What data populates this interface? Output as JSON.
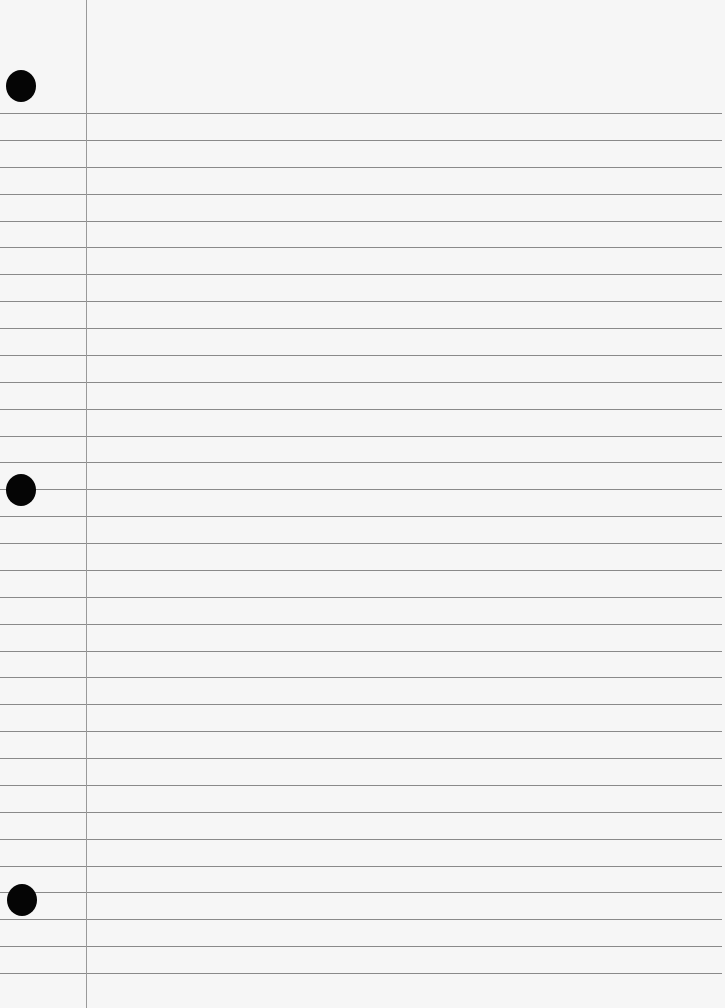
{
  "paper": {
    "type": "ruled notebook paper",
    "background_color": "#f6f6f6",
    "rule_color": "#8a8a8a",
    "margin_color": "#9a9a9a",
    "margin_x": 86,
    "first_rule_y": 113,
    "rule_spacing": 26.875,
    "rule_count": 33,
    "holes": [
      {
        "x": 6,
        "y": 70
      },
      {
        "x": 6,
        "y": 474
      },
      {
        "x": 7,
        "y": 884
      }
    ]
  }
}
